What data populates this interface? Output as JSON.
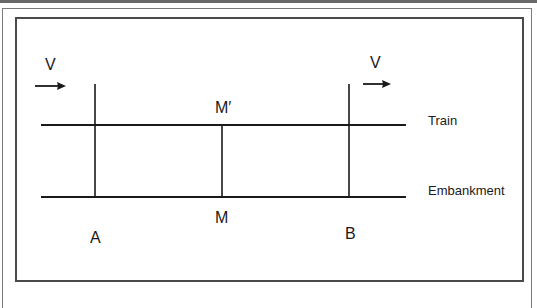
{
  "diagram": {
    "type": "relativity-simultaneity-train-embankment",
    "velocity_left_label": "V",
    "velocity_right_label": "V",
    "train_label": "Train",
    "embankment_label": "Embankment",
    "point_a_label": "A",
    "point_b_label": "B",
    "point_m_label": "M",
    "point_m_prime_label": "M′",
    "line_color": "#1a1a1a",
    "frame_color": "#4a4a4a"
  }
}
